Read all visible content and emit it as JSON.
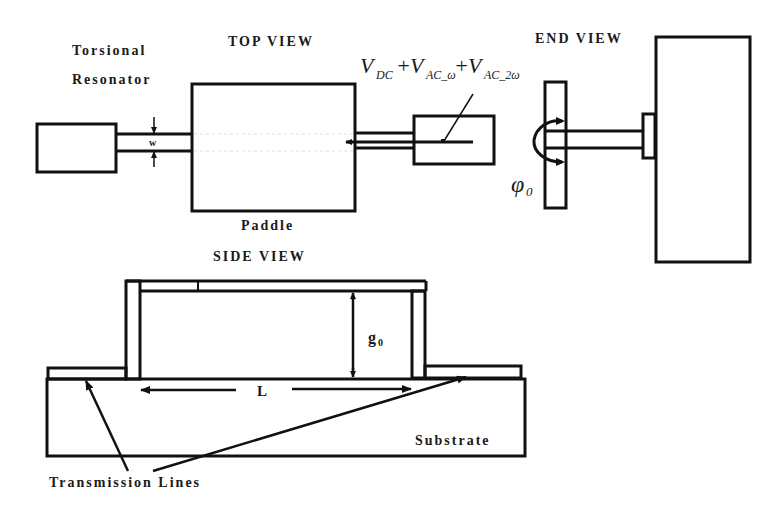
{
  "labels": {
    "torsional_line1": "Torsional",
    "torsional_line2": "Resonator",
    "top_view": "TOP VIEW",
    "end_view": "END VIEW",
    "side_view": "SIDE VIEW",
    "paddle": "Paddle",
    "width_symbol": "w",
    "gap_symbol": "g",
    "gap_subscript": "0",
    "length_symbol": "L",
    "substrate": "Substrate",
    "transmission_lines": "Transmission Lines",
    "angle_symbol": "φ",
    "angle_subscript": "0"
  },
  "voltage": {
    "v1": "V",
    "v1_sub": "DC",
    "plus1": "+",
    "v2": "V",
    "v2_sub": "AC_ω",
    "plus2": "+",
    "v3": "V",
    "v3_sub": "AC_2ω"
  },
  "colors": {
    "stroke": "#111111",
    "background": "#ffffff"
  }
}
